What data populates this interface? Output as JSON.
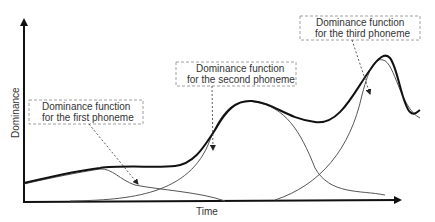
{
  "diagram": {
    "type": "dominance-function-plot",
    "axes": {
      "x_label": "Time",
      "y_label": "Dominance"
    },
    "annotations": [
      {
        "id": "first",
        "line1": "Dominance  function",
        "line2": "for the first  phoneme"
      },
      {
        "id": "second",
        "line1": "Dominance  function",
        "line2": "for the second  phoneme"
      },
      {
        "id": "third",
        "line1": "Dominance  function",
        "line2": "for the third  phoneme"
      }
    ],
    "curves": [
      {
        "name": "combined-dominance",
        "style": "thick"
      },
      {
        "name": "first-phoneme-dominance",
        "style": "thin"
      },
      {
        "name": "second-phoneme-dominance",
        "style": "thin"
      },
      {
        "name": "third-phoneme-dominance",
        "style": "thin"
      }
    ],
    "colors": {
      "stroke": "#111111",
      "thin": "#555555",
      "box": "#888888",
      "text": "#333333"
    }
  }
}
